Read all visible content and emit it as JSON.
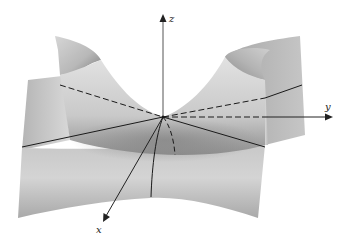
{
  "figure": {
    "axes": {
      "x": {
        "label": "x"
      },
      "y": {
        "label": "y"
      },
      "z": {
        "label": "z"
      }
    },
    "colors": {
      "background": "#ffffff",
      "surface_light": "#dcdcdc",
      "surface_mid": "#bdbdbd",
      "surface_dark": "#8e8e8e",
      "lines": "#1a1a1a",
      "axis": "#555555"
    },
    "curves": [
      {
        "id": "solid-diagonal-left",
        "style": "solid"
      },
      {
        "id": "solid-diagonal-right",
        "style": "solid"
      },
      {
        "id": "dashed-diagonal-left",
        "style": "dashed"
      },
      {
        "id": "dashed-diagonal-right",
        "style": "dashed"
      },
      {
        "id": "dashed-y-axis",
        "style": "dashed"
      },
      {
        "id": "front-parabola-solid",
        "style": "solid"
      },
      {
        "id": "front-parabola-dashed",
        "style": "dashed"
      }
    ]
  }
}
